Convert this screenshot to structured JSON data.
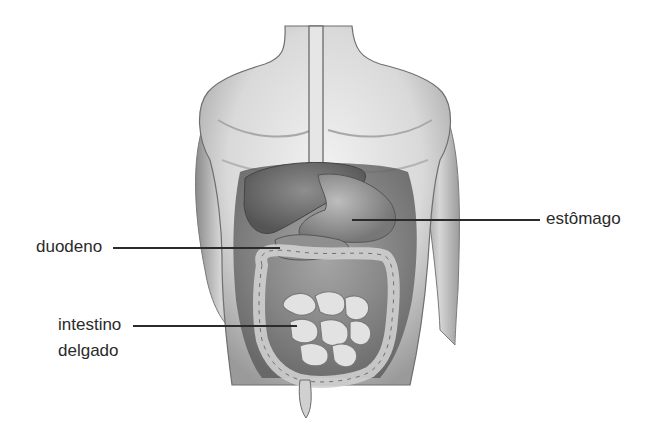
{
  "diagram": {
    "labels": [
      {
        "id": "estomago",
        "text": "estômago"
      },
      {
        "id": "duodeno",
        "text": "duodeno"
      },
      {
        "id": "intestino_delgado_line1",
        "text": "intestino"
      },
      {
        "id": "intestino_delgado_line2",
        "text": "delgado"
      }
    ]
  }
}
